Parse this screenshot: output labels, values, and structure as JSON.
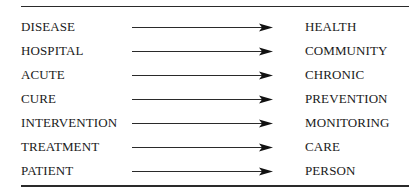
{
  "diagram": {
    "type": "paradigm-shift-table",
    "rows": [
      {
        "from": "DISEASE",
        "to": "HEALTH"
      },
      {
        "from": "HOSPITAL",
        "to": "COMMUNITY"
      },
      {
        "from": "ACUTE",
        "to": "CHRONIC"
      },
      {
        "from": "CURE",
        "to": "PREVENTION"
      },
      {
        "from": "INTERVENTION",
        "to": "MONITORING"
      },
      {
        "from": "TREATMENT",
        "to": "CARE"
      },
      {
        "from": "PATIENT",
        "to": "PERSON"
      }
    ],
    "connector_icon": "right-arrow-icon",
    "line_color": "#2a2a2a",
    "text_color": "#1a1a1a"
  }
}
